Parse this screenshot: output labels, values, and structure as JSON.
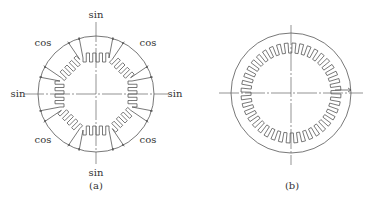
{
  "figure_a": {
    "caption": "(a)",
    "center": [
      96,
      94
    ],
    "radius": 58,
    "pole_count": 8,
    "labels": {
      "sin_top": "sin",
      "sin_bottom": "sin",
      "sin_left": "sin",
      "sin_right": "sin",
      "cos_top_left": "cos",
      "cos_top_right": "cos",
      "cos_bottom_left": "cos",
      "cos_bottom_right": "cos"
    }
  },
  "figure_b": {
    "caption": "(b)",
    "center": [
      291,
      93
    ],
    "radius": 60,
    "tooth_count": 40
  },
  "colors": {
    "stroke": "#555555",
    "text": "#333333",
    "background": "#ffffff"
  }
}
